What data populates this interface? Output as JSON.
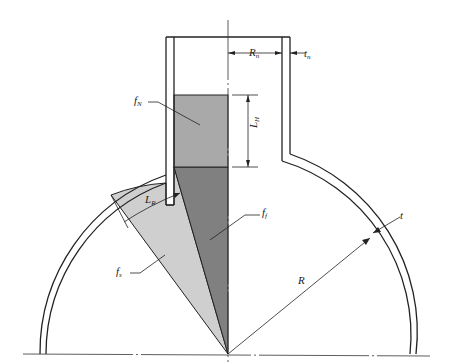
{
  "diagram": {
    "type": "spherical tank with vertical neck, liquid regions and dimension labels",
    "colors": {
      "line": "#222222",
      "region_fN": "#a9a9a9",
      "region_ff": "#808080",
      "region_fs": "#cfcfcf",
      "background": "#ffffff"
    },
    "labels": {
      "fN": {
        "main": "f",
        "sub": "N"
      },
      "ff": {
        "main": "f",
        "sub": "f"
      },
      "fs": {
        "main": "f",
        "sub": "s"
      },
      "LH": {
        "main": "L",
        "sub": "H"
      },
      "LR": {
        "main": "L",
        "sub": "R"
      },
      "Rn": {
        "main": "R",
        "sub": "n"
      },
      "tn": {
        "main": "t",
        "sub": "n"
      },
      "t": {
        "main": "t",
        "sub": ""
      },
      "R": {
        "main": "R",
        "sub": ""
      }
    },
    "regions": [
      {
        "id": "fN",
        "description": "liquid in neck (rectangle)"
      },
      {
        "id": "ff",
        "description": "dark triangular region under neck"
      },
      {
        "id": "fs",
        "description": "light sector region in sphere"
      }
    ],
    "dimensions": [
      {
        "id": "Rn",
        "description": "neck inner radius"
      },
      {
        "id": "tn",
        "description": "neck wall thickness"
      },
      {
        "id": "LH",
        "description": "neck liquid height"
      },
      {
        "id": "LR",
        "description": "sector arc length"
      },
      {
        "id": "R",
        "description": "sphere radius"
      },
      {
        "id": "t",
        "description": "sphere wall thickness"
      }
    ]
  }
}
